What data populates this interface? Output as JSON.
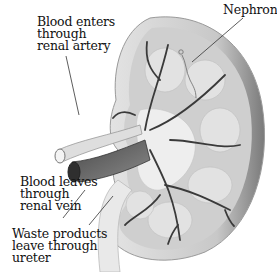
{
  "diagram": {
    "style": "grayscale illustration",
    "colors": {
      "background": "#ffffff",
      "text": "#111111",
      "cortex": "#cfcfcf",
      "medulla": "#e2e2e2",
      "vessel_dark": "#3a3a3a",
      "artery": "#dcdcdc",
      "vein": "#6a6a6a",
      "leader_line": "#333333"
    },
    "labels": [
      {
        "id": "artery",
        "lines": [
          "Blood enters",
          "through",
          "renal artery"
        ]
      },
      {
        "id": "nephron",
        "lines": [
          "Nephron"
        ]
      },
      {
        "id": "vein",
        "lines": [
          "Blood leaves",
          "through",
          "renal vein"
        ]
      },
      {
        "id": "ureter",
        "lines": [
          "Waste products",
          "leave through",
          "ureter"
        ]
      }
    ]
  }
}
